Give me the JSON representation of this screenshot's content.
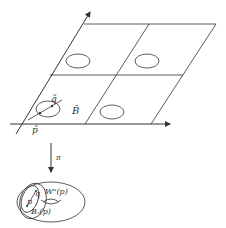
{
  "diagram": {
    "labels": {
      "q_tilde": "q̃",
      "p_tilde": "p̃",
      "B_tilde": "B̃",
      "pi": "π",
      "W_label": "Wᵘ(p)",
      "q": "q",
      "p": "p",
      "B_label": "Bₛ(p)"
    },
    "stroke_color": "#333333"
  }
}
